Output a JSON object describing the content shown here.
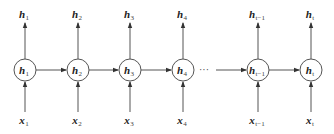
{
  "diagram": {
    "title": "",
    "type": "unrolled-rnn",
    "colors": {
      "stroke": "#555555",
      "text": "#222222",
      "background": "#ffffff"
    },
    "nodes": [
      {
        "id": "h1",
        "cx": 25,
        "label": "h",
        "sub": "1"
      },
      {
        "id": "h2",
        "cx": 78,
        "label": "h",
        "sub": "2"
      },
      {
        "id": "h3",
        "cx": 130,
        "label": "h",
        "sub": "3"
      },
      {
        "id": "h4",
        "cx": 183,
        "label": "h",
        "sub": "4"
      },
      {
        "id": "ht-1",
        "cx": 258,
        "label": "h",
        "sub": "t−1"
      },
      {
        "id": "ht",
        "cx": 311,
        "label": "h",
        "sub": "t"
      }
    ],
    "outputs": [
      {
        "label": "h",
        "sub": "1"
      },
      {
        "label": "h",
        "sub": "2"
      },
      {
        "label": "h",
        "sub": "3"
      },
      {
        "label": "h",
        "sub": "4"
      },
      {
        "label": "h",
        "sub": "t−1"
      },
      {
        "label": "h",
        "sub": "t"
      }
    ],
    "inputs": [
      {
        "label": "x",
        "sub": "1"
      },
      {
        "label": "x",
        "sub": "2"
      },
      {
        "label": "x",
        "sub": "3"
      },
      {
        "label": "x",
        "sub": "4"
      },
      {
        "label": "x",
        "sub": "t−1"
      },
      {
        "label": "x",
        "sub": "t"
      }
    ],
    "ellipsis": "···",
    "edges": [
      {
        "from": "h1",
        "to": "h2"
      },
      {
        "from": "h2",
        "to": "h3"
      },
      {
        "from": "h3",
        "to": "h4"
      },
      {
        "from": "h4",
        "to": "ht-1",
        "ellipsis": true
      },
      {
        "from": "ht-1",
        "to": "ht"
      }
    ]
  }
}
